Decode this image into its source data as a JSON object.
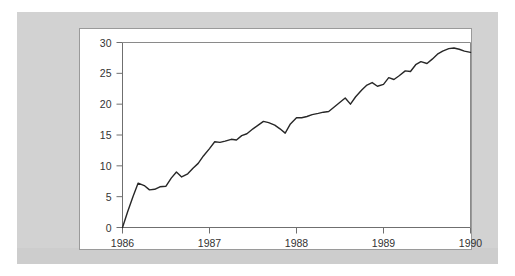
{
  "figure": {
    "background_color": "#d2d2d2",
    "card_color": "#ffffff",
    "card_border_color": "#9a9a9a"
  },
  "chart_data": {
    "type": "line",
    "title": "",
    "subtitle": "",
    "xlabel": "",
    "ylabel": "",
    "grid": false,
    "legend": null,
    "line_color": "#272727",
    "axis_color": "#6f6f6f",
    "xlim": [
      1986.0,
      1990.0
    ],
    "ylim": [
      0,
      30
    ],
    "yticks": [
      0,
      5,
      10,
      15,
      20,
      25,
      30
    ],
    "ytick_labels": [
      "0",
      "5",
      "10",
      "15",
      "20",
      "25",
      "30"
    ],
    "xticks": [
      1986,
      1987,
      1988,
      1989,
      1990
    ],
    "xtick_labels": [
      "1986",
      "1987",
      "1988",
      "1989",
      "1990"
    ],
    "series": [
      {
        "name": "series-1",
        "x": [
          1986.0,
          1986.06,
          1986.12,
          1986.18,
          1986.25,
          1986.31,
          1986.37,
          1986.43,
          1986.5,
          1986.56,
          1986.62,
          1986.68,
          1986.75,
          1986.81,
          1986.87,
          1986.93,
          1987.0,
          1987.06,
          1987.12,
          1987.18,
          1987.25,
          1987.31,
          1987.37,
          1987.43,
          1987.5,
          1987.56,
          1987.62,
          1987.68,
          1987.75,
          1987.81,
          1987.87,
          1987.93,
          1988.0,
          1988.06,
          1988.12,
          1988.18,
          1988.25,
          1988.31,
          1988.37,
          1988.43,
          1988.5,
          1988.56,
          1988.62,
          1988.68,
          1988.75,
          1988.81,
          1988.87,
          1988.93,
          1989.0,
          1989.06,
          1989.12,
          1989.18,
          1989.25,
          1989.31,
          1989.37,
          1989.43,
          1989.5,
          1989.56,
          1989.62,
          1989.68,
          1989.75,
          1989.81,
          1989.87,
          1989.93,
          1990.0
        ],
        "values": [
          0.0,
          2.6,
          5.0,
          7.2,
          6.8,
          6.1,
          6.2,
          6.6,
          6.7,
          8.0,
          9.0,
          8.2,
          8.7,
          9.6,
          10.4,
          11.6,
          12.8,
          13.9,
          13.8,
          14.0,
          14.3,
          14.2,
          14.9,
          15.2,
          16.0,
          16.6,
          17.2,
          17.0,
          16.6,
          16.0,
          15.3,
          16.8,
          17.8,
          17.8,
          18.0,
          18.3,
          18.5,
          18.7,
          18.8,
          19.5,
          20.3,
          21.0,
          20.0,
          21.2,
          22.3,
          23.1,
          23.5,
          22.9,
          23.2,
          24.3,
          24.0,
          24.6,
          25.4,
          25.3,
          26.4,
          26.9,
          26.6,
          27.3,
          28.1,
          28.6,
          29.0,
          29.1,
          28.9,
          28.6,
          28.4
        ]
      }
    ]
  }
}
